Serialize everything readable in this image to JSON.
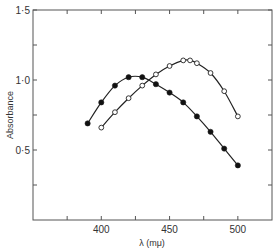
{
  "chart_data": {
    "type": "line",
    "title": "",
    "xlabel": "λ (mμ)",
    "ylabel": "Absorbance",
    "xlim": [
      350,
      525
    ],
    "ylim": [
      0,
      1.5
    ],
    "x_ticks": [
      375,
      400,
      425,
      450,
      475,
      500
    ],
    "x_tick_labels": [
      {
        "value": 400,
        "label": "400"
      },
      {
        "value": 450,
        "label": "450"
      },
      {
        "value": 500,
        "label": "500"
      }
    ],
    "y_ticks": [
      0.25,
      0.5,
      0.75,
      1.0,
      1.25,
      1.5
    ],
    "y_tick_labels": [
      {
        "value": 0.5,
        "label": "0·5"
      },
      {
        "value": 1.0,
        "label": "1·0"
      },
      {
        "value": 1.5,
        "label": "1·5"
      }
    ],
    "grid": false,
    "legend": "none",
    "series": [
      {
        "name": "filled-circles",
        "marker": "filled-circle",
        "x": [
          390,
          400,
          410,
          420,
          430,
          440,
          450,
          460,
          470,
          480,
          490,
          500
        ],
        "y": [
          0.69,
          0.84,
          0.96,
          1.02,
          1.02,
          0.97,
          0.91,
          0.84,
          0.74,
          0.63,
          0.51,
          0.39
        ]
      },
      {
        "name": "open-circles",
        "marker": "open-circle",
        "x": [
          400,
          410,
          420,
          430,
          440,
          450,
          460,
          465,
          470,
          480,
          490,
          500
        ],
        "y": [
          0.66,
          0.77,
          0.87,
          0.96,
          1.04,
          1.1,
          1.14,
          1.14,
          1.12,
          1.05,
          0.92,
          0.74
        ]
      }
    ]
  }
}
